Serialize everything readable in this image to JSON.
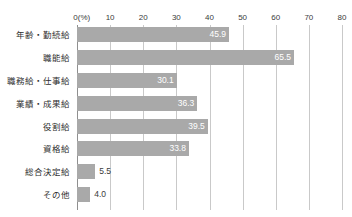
{
  "figure": {
    "clipped_title": "",
    "axis_unit_label": "0(%)"
  },
  "chart_data": {
    "type": "bar",
    "orientation": "horizontal",
    "title": "",
    "xlabel": "0(%)",
    "ylabel": "",
    "xlim": [
      0,
      80
    ],
    "xticks": [
      "0(%)",
      "10",
      "20",
      "30",
      "40",
      "50",
      "60",
      "70",
      "80"
    ],
    "xtick_values": [
      0,
      10,
      20,
      30,
      40,
      50,
      60,
      70,
      80
    ],
    "grid": true,
    "legend": false,
    "bar_color": "#a9a9a9",
    "inside_label_color": "#ffffff",
    "outside_label_color": "#3b3b3b",
    "categories": [
      "年齢・勤続給",
      "職能給",
      "職務給・仕事給",
      "業績・成果給",
      "役割給",
      "資格給",
      "総合決定給",
      "その他"
    ],
    "values": [
      45.9,
      65.5,
      30.1,
      36.3,
      39.5,
      33.8,
      5.5,
      4.0
    ],
    "value_labels": [
      "45.9",
      "65.5",
      "30.1",
      "36.3",
      "39.5",
      "33.8",
      "5.5",
      "4.0"
    ],
    "label_placement": [
      "inside",
      "inside",
      "inside",
      "inside",
      "inside",
      "inside",
      "outside",
      "outside"
    ]
  }
}
